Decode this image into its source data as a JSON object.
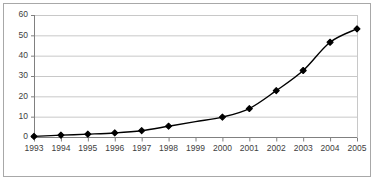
{
  "chart_data": {
    "type": "line",
    "title": "",
    "subtitle": "",
    "xlabel": "",
    "ylabel": "",
    "categories": [
      "1993",
      "1994",
      "1995",
      "1996",
      "1997",
      "1998",
      "1999",
      "2000",
      "2001",
      "2002",
      "2003",
      "2004",
      "2005"
    ],
    "values": [
      0.3,
      0.9,
      1.4,
      2.0,
      3.1,
      5.3,
      null,
      9.8,
      14.0,
      22.8,
      32.7,
      46.6,
      53.2
    ],
    "series": [
      {
        "name": "Series 1",
        "values": [
          0.3,
          0.9,
          1.4,
          2.0,
          3.1,
          5.3,
          null,
          9.8,
          14.0,
          22.8,
          32.7,
          46.6,
          53.2
        ]
      }
    ],
    "ylim": [
      0,
      60
    ],
    "ytick_labels": [
      "0",
      "10",
      "20",
      "30",
      "40",
      "50",
      "60"
    ],
    "ytick_values": [
      0,
      10,
      20,
      30,
      40,
      50,
      60
    ],
    "xtick_labels": [
      "1993",
      "1994",
      "1995",
      "1996",
      "1997",
      "1998",
      "1999",
      "2000",
      "2001",
      "2002",
      "2003",
      "2004",
      "2005"
    ],
    "grid": {
      "horizontal": true,
      "vertical": false
    },
    "legend": {
      "visible": false,
      "position": "none",
      "entries": []
    },
    "marker": {
      "shape": "diamond",
      "color": "#000000",
      "size": 4
    },
    "line": {
      "color": "#000000",
      "width": 1.4
    },
    "annotations": []
  },
  "colors": {
    "plot_background": "#ffffff",
    "grid_line": "#c8c8c8",
    "axis_line": "#808080",
    "tick_label": "#404040",
    "frame_border": "#a8a8a8",
    "page_background": "#ffffff"
  }
}
